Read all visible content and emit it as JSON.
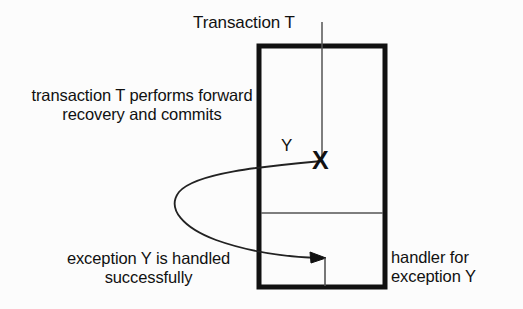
{
  "diagram": {
    "title_label": "Transaction T",
    "left_annotation": "transaction T performs forward recovery and commits",
    "bottom_annotation": "exception Y is handled successfully",
    "handler_annotation": "handler for exception Y",
    "exception_label": "Y",
    "raise_marker": "X",
    "colors": {
      "background": "#fcfcfc",
      "stroke": "#111111",
      "thin_stroke": "#555555",
      "text": "#111111"
    }
  }
}
